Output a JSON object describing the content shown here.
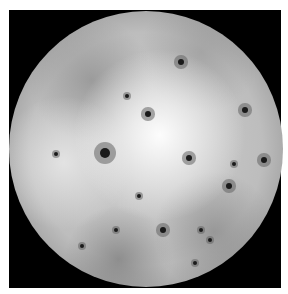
{
  "image": {
    "subject": "moon",
    "description": "Grayscale photograph of a cratered, volcanic moon on a black background",
    "colors": {
      "background": "#000000",
      "border": "#ffffff",
      "surface_light": "#f0f0f0",
      "surface_mid": "#bdbdbd",
      "surface_dark": "#5a5a5a"
    },
    "spots": [
      {
        "x": 181,
        "y": 62,
        "r": 3
      },
      {
        "x": 127,
        "y": 96,
        "r": 2
      },
      {
        "x": 148,
        "y": 114,
        "r": 3
      },
      {
        "x": 105,
        "y": 153,
        "r": 5
      },
      {
        "x": 234,
        "y": 164,
        "r": 2
      },
      {
        "x": 189,
        "y": 158,
        "r": 3
      },
      {
        "x": 139,
        "y": 196,
        "r": 2
      },
      {
        "x": 163,
        "y": 230,
        "r": 3
      },
      {
        "x": 201,
        "y": 230,
        "r": 2
      },
      {
        "x": 210,
        "y": 240,
        "r": 2
      },
      {
        "x": 82,
        "y": 246,
        "r": 2
      },
      {
        "x": 56,
        "y": 154,
        "r": 2
      },
      {
        "x": 245,
        "y": 110,
        "r": 3
      },
      {
        "x": 264,
        "y": 160,
        "r": 3
      },
      {
        "x": 229,
        "y": 186,
        "r": 3
      },
      {
        "x": 116,
        "y": 230,
        "r": 2
      },
      {
        "x": 195,
        "y": 263,
        "r": 2
      }
    ]
  }
}
